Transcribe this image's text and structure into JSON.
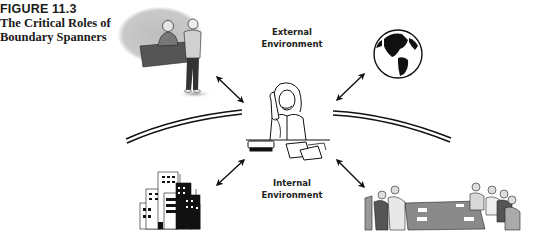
{
  "figure": {
    "number": "FIGURE 11.3",
    "title_line1": "The Critical Roles of",
    "title_line2": "Boundary Spanners"
  },
  "labels": {
    "external_line1": "External",
    "external_line2": "Environment",
    "internal_line1": "Internal",
    "internal_line2": "Environment"
  },
  "nodes": [
    {
      "id": "center",
      "label": "Boundary spanner on telephone at desk",
      "icon": "woman-on-phone-icon"
    },
    {
      "id": "top-left",
      "label": "Two men meeting at desk",
      "icon": "people-meeting-icon"
    },
    {
      "id": "top-right",
      "label": "Globe",
      "icon": "globe-icon"
    },
    {
      "id": "bottom-left",
      "label": "Office building",
      "icon": "building-icon"
    },
    {
      "id": "bottom-right",
      "label": "Conference table meeting",
      "icon": "conference-meeting-icon"
    }
  ],
  "colors": {
    "ink": "#111111",
    "gray": "#8a8a8a",
    "light_gray": "#c8c8c8"
  }
}
